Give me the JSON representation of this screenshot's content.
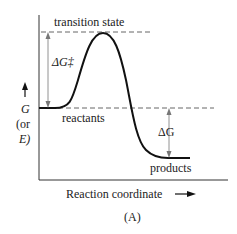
{
  "diagram": {
    "caption": "(A)",
    "labels": {
      "transition_state": "transition state",
      "reactants": "reactants",
      "products": "products",
      "activation_energy": "ΔG‡",
      "delta_g": "ΔG",
      "y_axis_main": "G",
      "y_axis_alt_open": "(or",
      "y_axis_alt_var": "E)",
      "x_axis": "Reaction coordinate"
    },
    "colors": {
      "line": "#1a1a1a",
      "dash": "#555555",
      "arrow": "#666666"
    }
  }
}
